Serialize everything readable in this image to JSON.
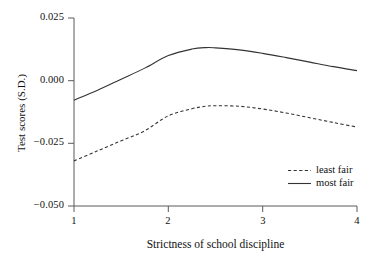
{
  "chart_data": {
    "type": "line",
    "title": "",
    "xlabel": "Strictness of school discipline",
    "ylabel": "Test scores (S.D.)",
    "xlim": [
      1,
      4
    ],
    "ylim": [
      -0.05,
      0.025
    ],
    "grid": false,
    "legend_position": "inside-bottom-right",
    "xticks": [
      "1",
      "2",
      "3",
      "4"
    ],
    "xtick_values": [
      1,
      2,
      3,
      4
    ],
    "yticks": [
      "0.025",
      "0.000",
      "−0.025",
      "−0.050"
    ],
    "ytick_values": [
      0.025,
      0.0,
      -0.025,
      -0.05
    ],
    "x": [
      1.0,
      1.25,
      1.5,
      1.75,
      2.0,
      2.25,
      2.4,
      2.5,
      2.75,
      3.0,
      3.25,
      3.5,
      3.75,
      4.0
    ],
    "series": [
      {
        "name": "most fair",
        "style": "solid",
        "color": "#333333",
        "values": [
          -0.0078,
          -0.0038,
          0.0006,
          0.005,
          0.01,
          0.0126,
          0.0132,
          0.0131,
          0.0123,
          0.0109,
          0.0092,
          0.0074,
          0.0056,
          0.004
        ]
      },
      {
        "name": "least fair",
        "style": "dashed",
        "color": "#333333",
        "values": [
          -0.032,
          -0.028,
          -0.024,
          -0.02,
          -0.014,
          -0.0112,
          -0.0102,
          -0.01,
          -0.0102,
          -0.0113,
          -0.0129,
          -0.0148,
          -0.0167,
          -0.0185
        ]
      }
    ]
  },
  "legend": {
    "entries": [
      {
        "label": "least fair",
        "style": "dashed"
      },
      {
        "label": "most fair",
        "style": "solid"
      }
    ]
  },
  "axes": {
    "x_title": "Strictness of school discipline",
    "y_title": "Test scores (S.D.)",
    "y_labels": [
      "0.025",
      "0.000",
      "−0.025",
      "−0.050"
    ],
    "x_labels": [
      "1",
      "2",
      "3",
      "4"
    ]
  }
}
